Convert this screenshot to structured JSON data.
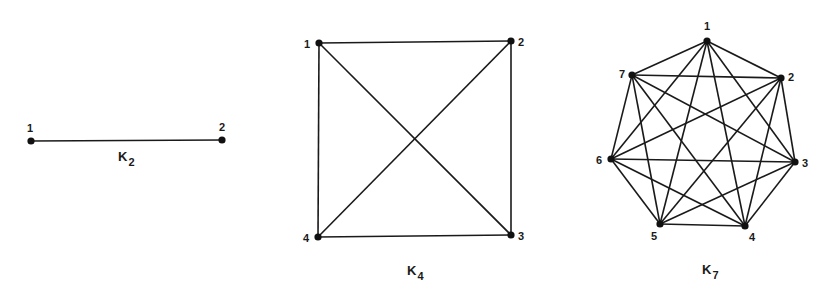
{
  "figure": {
    "colors": {
      "ink": "#1a1a1a",
      "background": "#ffffff"
    },
    "graphs": [
      {
        "id": "k2",
        "name": "K",
        "subscript": "2",
        "label_pos": [
          118,
          161
        ],
        "nodes": [
          {
            "id": "1",
            "x": 31,
            "y": 141,
            "lx": 27,
            "ly": 132
          },
          {
            "id": "2",
            "x": 222,
            "y": 140,
            "lx": 219,
            "ly": 131
          }
        ]
      },
      {
        "id": "k4",
        "name": "K",
        "subscript": "4",
        "label_pos": [
          407,
          275
        ],
        "nodes": [
          {
            "id": "1",
            "x": 319,
            "y": 43,
            "lx": 304,
            "ly": 48
          },
          {
            "id": "2",
            "x": 511,
            "y": 41,
            "lx": 518,
            "ly": 46
          },
          {
            "id": "3",
            "x": 511,
            "y": 235,
            "lx": 518,
            "ly": 240
          },
          {
            "id": "4",
            "x": 318,
            "y": 237,
            "lx": 303,
            "ly": 242
          }
        ]
      },
      {
        "id": "k7",
        "name": "K",
        "subscript": "7",
        "label_pos": [
          702,
          274
        ],
        "nodes": [
          {
            "id": "1",
            "x": 707,
            "y": 41,
            "lx": 704,
            "ly": 30
          },
          {
            "id": "2",
            "x": 781,
            "y": 78,
            "lx": 788,
            "ly": 81
          },
          {
            "id": "3",
            "x": 795,
            "y": 162,
            "lx": 802,
            "ly": 167
          },
          {
            "id": "4",
            "x": 745,
            "y": 226,
            "lx": 749,
            "ly": 241
          },
          {
            "id": "5",
            "x": 660,
            "y": 224,
            "lx": 651,
            "ly": 240
          },
          {
            "id": "6",
            "x": 611,
            "y": 159,
            "lx": 596,
            "ly": 164
          },
          {
            "id": "7",
            "x": 632,
            "y": 75,
            "lx": 619,
            "ly": 78
          }
        ]
      }
    ]
  }
}
